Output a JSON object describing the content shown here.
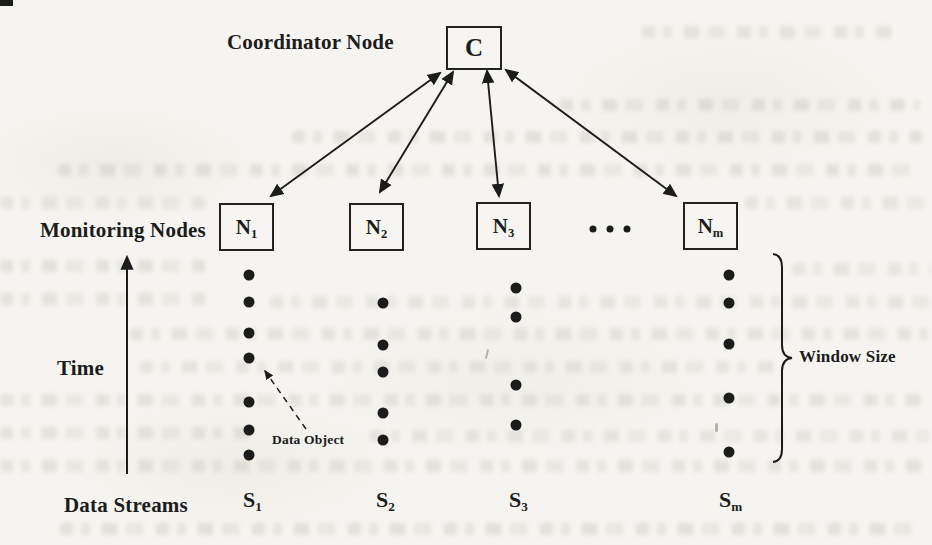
{
  "figure_caption_labels": {
    "coordinator": "Coordinator Node",
    "monitoring": "Monitoring Nodes",
    "time": "Time",
    "data_streams": "Data Streams",
    "data_object": "Data Object",
    "window_size": "Window Size"
  },
  "coordinator_node": {
    "label": "C"
  },
  "monitoring_nodes": [
    {
      "base": "N",
      "sub": "1"
    },
    {
      "base": "N",
      "sub": "2"
    },
    {
      "base": "N",
      "sub": "3"
    },
    {
      "base": "N",
      "sub": "m"
    }
  ],
  "streams": [
    {
      "base": "S",
      "sub": "1",
      "dot_x": 249,
      "dot_ys": [
        275,
        302,
        333,
        358,
        402,
        430,
        455
      ]
    },
    {
      "base": "S",
      "sub": "2",
      "dot_x": 383,
      "dot_ys": [
        303,
        345,
        372,
        413,
        440
      ]
    },
    {
      "base": "S",
      "sub": "3",
      "dot_x": 516,
      "dot_ys": [
        288,
        317,
        385,
        425
      ]
    },
    {
      "base": "S",
      "sub": "m",
      "dot_x": 729,
      "dot_ys": [
        275,
        303,
        344,
        398,
        452
      ]
    }
  ],
  "figure": {
    "dot_radius": 5.5,
    "ellipsis_dots": {
      "x": [
        593,
        610,
        627
      ],
      "y": 229,
      "r": 3.5
    }
  },
  "colors": {
    "ink": "#1c1c1c",
    "paper": "#f5f4f0"
  }
}
